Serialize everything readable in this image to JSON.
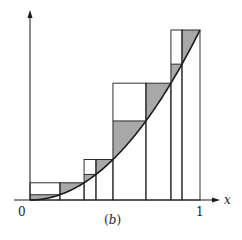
{
  "figure": {
    "caption_open": "(",
    "caption_letter": "b",
    "caption_close": ")",
    "x_axis_label": "x",
    "origin_label": "0",
    "end_label": "1",
    "curve": "y = x^2",
    "domain": [
      0,
      1
    ],
    "colors": {
      "ink": "#1a1a1a",
      "shade": "#a8a8a8",
      "background": "#ffffff"
    },
    "partition": [
      0,
      0.176,
      0.318,
      0.388,
      0.488,
      0.682,
      0.829,
      0.894,
      1.0
    ],
    "shaded_pairs": [
      {
        "x0": 0,
        "x1": 0.176
      },
      {
        "x0": 0.318,
        "x1": 0.388
      },
      {
        "x0": 0.488,
        "x1": 0.682
      },
      {
        "x0": 0.829,
        "x1": 0.894
      }
    ],
    "secondary_pairs": [
      {
        "x0": 0.176,
        "x1": 0.318
      },
      {
        "x0": 0.388,
        "x1": 0.488
      },
      {
        "x0": 0.682,
        "x1": 0.829
      },
      {
        "x0": 0.894,
        "x1": 1.0
      }
    ]
  }
}
